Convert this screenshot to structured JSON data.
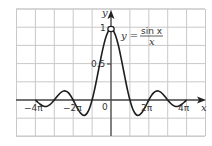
{
  "chart_data": {
    "type": "line",
    "title": "",
    "function": "y = sin x / x",
    "xlabel": "x",
    "ylabel": "y",
    "x_unit": "pi",
    "x_range_in_pi": [
      -4,
      4
    ],
    "grid": true,
    "grid_extent_in_pi": [
      -5,
      5
    ],
    "ylim": [
      -0.5,
      1.25
    ],
    "x_ticks": [
      {
        "value_in_pi": -4,
        "label": "−4π"
      },
      {
        "value_in_pi": -2,
        "label": "−2π"
      },
      {
        "value_in_pi": 2,
        "label": "2π"
      },
      {
        "value_in_pi": 4,
        "label": "4π"
      }
    ],
    "y_ticks": [
      {
        "value": 0.5,
        "label": "0.5"
      },
      {
        "value": 1,
        "label": "1"
      }
    ],
    "origin_label": "0",
    "hole_at": {
      "x": 0,
      "y": 1
    },
    "series": [
      {
        "name": "sin x / x",
        "x_in_pi_step": 0.125,
        "half_values_from_0": [
          1,
          0.9745,
          0.9003,
          0.7842,
          0.6366,
          0.4705,
          0.3001,
          0.1392,
          0,
          -0.1083,
          -0.1801,
          -0.2139,
          -0.2122,
          -0.181,
          -0.1286,
          -0.065,
          0,
          0.0573,
          0.1,
          0.1238,
          0.1273,
          0.112,
          0.0818,
          0.0424,
          0,
          -0.039,
          -0.0693,
          -0.0871,
          -0.0909,
          -0.0811,
          -0.06,
          -0.0314,
          0
        ],
        "symmetric": true
      }
    ]
  },
  "labels": {
    "y_axis": "y",
    "x_axis": "x",
    "origin": "0",
    "y_half": "0.5",
    "y_one": "1",
    "x_neg4pi": "−4π",
    "x_neg2pi": "−2π",
    "x_2pi": "2π",
    "x_4pi": "4π",
    "formula_lhs": "y =",
    "formula_num": "sin x",
    "formula_den": "x"
  },
  "colors": {
    "grid": "#c9c9c9",
    "axis": "#4a4a4a",
    "curve": "#1e1e1e",
    "background": "#ffffff"
  }
}
